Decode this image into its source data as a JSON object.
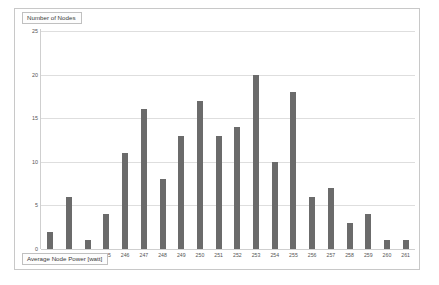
{
  "chart_data": {
    "type": "bar",
    "title": "",
    "xlabel": "Average Node Power [watt]",
    "ylabel": "Number of Nodes",
    "categories": [
      "240",
      "243",
      "244",
      "245",
      "246",
      "247",
      "248",
      "249",
      "250",
      "251",
      "252",
      "253",
      "254",
      "255",
      "256",
      "257",
      "258",
      "259",
      "260",
      "261"
    ],
    "values": [
      2,
      6,
      1,
      4,
      11,
      16,
      8,
      13,
      17,
      13,
      14,
      20,
      10,
      18,
      6,
      7,
      3,
      4,
      1,
      1
    ],
    "yticks": [
      "0",
      "5",
      "10",
      "15",
      "20",
      "25"
    ],
    "ytick_values": [
      0,
      5,
      10,
      15,
      20,
      25
    ],
    "ylim": [
      0,
      25
    ],
    "grid": true,
    "legend": "none",
    "bar_color": "#6b6b6b",
    "gridline_color": "#dedede",
    "frame_color": "#c8c8c8"
  }
}
